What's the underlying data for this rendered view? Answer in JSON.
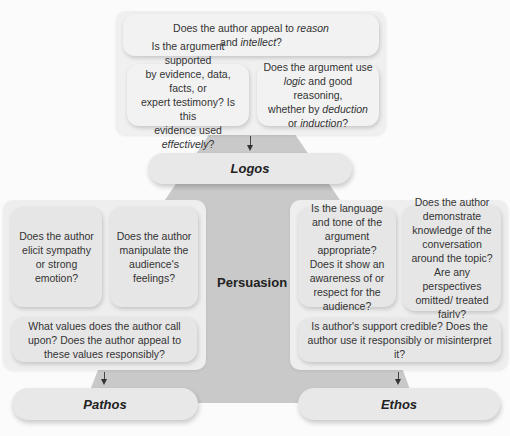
{
  "diagram": {
    "center_label": "Persuasion",
    "colors": {
      "background": "#fbfbfb",
      "pyramid": "#c9c9c9",
      "panel": "#eeeeee",
      "box": "#e6e6e6"
    },
    "logos": {
      "label": "Logos",
      "main_question": {
        "line1_pre": "Does the author appeal to ",
        "line1_em": "reason",
        "line2_pre": "and ",
        "line2_em": "intellect",
        "line2_post": "?"
      },
      "left_question": {
        "line1": "Is the argument supported",
        "line2": "by evidence, data, facts, or",
        "line3": "expert testimony? Is this",
        "line4_pre": "evidence used ",
        "line4_em": "effectively",
        "line4_post": "?"
      },
      "right_question": {
        "line1": "Does the argument use",
        "line2_em": "logic",
        "line2_post": " and good reasoning,",
        "line3_pre": "whether by ",
        "line3_em": "deduction",
        "line4_pre": "or ",
        "line4_em": "induction",
        "line4_post": "?"
      }
    },
    "pathos": {
      "label": "Pathos",
      "questions": [
        "Does the author elicit sympathy or strong emotion?",
        "Does the author manipulate the audience's feelings?",
        "What values does the author call upon? Does the author appeal to these values responsibly?"
      ]
    },
    "ethos": {
      "label": "Ethos",
      "questions": [
        "Is the language and tone of the argument appropriate? Does it show an awareness of or respect for the audience?",
        "Does the author demonstrate knowledge of the conversation around the topic? Are any perspectives omitted/ treated fairly?",
        "Is author's support credible? Does the author use it responsibly or misinterpret it?"
      ]
    }
  }
}
